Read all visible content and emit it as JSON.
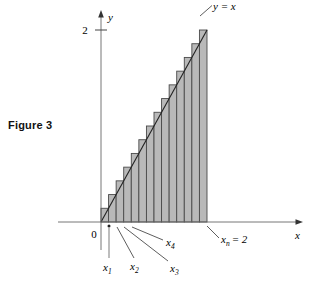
{
  "figure": {
    "caption": "Figure 3",
    "background_color": "#ffffff",
    "bar_fill_color": "#b9b9b9",
    "bar_stroke_color": "#4a4a4a",
    "axis_color": "#555555",
    "line_color": "#222222"
  },
  "labels": {
    "y_axis": "y",
    "x_axis": "x",
    "origin": "0",
    "y_tick_2": "2",
    "curve": "y = x",
    "x1": "x",
    "x1_sub": "1",
    "x2": "x",
    "x2_sub": "2",
    "x3": "x",
    "x3_sub": "3",
    "x4": "x",
    "x4_sub": "4",
    "xn": "x",
    "xn_sub": "n",
    "xn_eq": "= 2"
  },
  "chart_data": {
    "type": "bar",
    "title": "Figure 3",
    "subtitle": "Right-endpoint Riemann sum for y = x on [0, 2]",
    "xlabel": "x",
    "ylabel": "y",
    "xlim": [
      0,
      2
    ],
    "ylim": [
      0,
      2
    ],
    "grid": false,
    "legend": null,
    "n_rectangles": 14,
    "delta_x": 0.142857,
    "function": "y = x",
    "categories": [
      "x1",
      "x2",
      "x3",
      "x4",
      "x5",
      "x6",
      "x7",
      "x8",
      "x9",
      "x10",
      "x11",
      "x12",
      "x13",
      "xn"
    ],
    "x_right_endpoints": [
      0.1429,
      0.2857,
      0.4286,
      0.5714,
      0.7143,
      0.8571,
      1.0,
      1.1429,
      1.2857,
      1.4286,
      1.5714,
      1.7143,
      1.8571,
      2.0
    ],
    "values": [
      0.1429,
      0.2857,
      0.4286,
      0.5714,
      0.7143,
      0.8571,
      1.0,
      1.1429,
      1.2857,
      1.4286,
      1.5714,
      1.7143,
      1.8571,
      2.0
    ],
    "series": [
      {
        "name": "Inscribed/right-endpoint rectangles",
        "values": [
          0.1429,
          0.2857,
          0.4286,
          0.5714,
          0.7143,
          0.8571,
          1.0,
          1.1429,
          1.2857,
          1.4286,
          1.5714,
          1.7143,
          1.8571,
          2.0
        ]
      },
      {
        "name": "y = x",
        "x": [
          0,
          2
        ],
        "values": [
          0,
          2
        ]
      }
    ],
    "y_ticks": [
      2
    ],
    "y_tick_labels": [
      "2"
    ],
    "x_ticks": [
      0
    ],
    "x_tick_labels": [
      "0"
    ],
    "annotations": [
      {
        "text": "y = x",
        "target_x": 1.72,
        "target_y": 1.72
      },
      {
        "text": "x1",
        "target_x": 0.1429,
        "target_y": 0
      },
      {
        "text": "x2",
        "target_x": 0.2857,
        "target_y": 0
      },
      {
        "text": "x3",
        "target_x": 0.4286,
        "target_y": 0
      },
      {
        "text": "x4",
        "target_x": 0.5714,
        "target_y": 0
      },
      {
        "text": "xn = 2",
        "target_x": 2.0,
        "target_y": 0
      }
    ]
  }
}
